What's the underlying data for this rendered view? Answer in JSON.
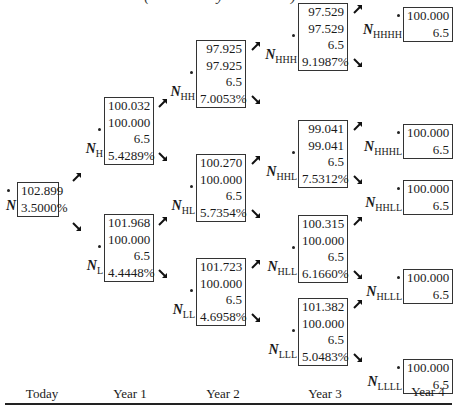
{
  "title_partial": "(cut off at top)",
  "nodes": {
    "N": {
      "label_main": "N",
      "label_sub": "",
      "values": [
        "102.899",
        "3.5000%"
      ]
    },
    "NH": {
      "label_main": "N",
      "label_sub": "H",
      "values": [
        "100.032",
        "100.000",
        "6.5",
        "5.4289%"
      ]
    },
    "NL": {
      "label_main": "N",
      "label_sub": "L",
      "values": [
        "101.968",
        "100.000",
        "6.5",
        "4.4448%"
      ]
    },
    "NHH": {
      "label_main": "N",
      "label_sub": "HH",
      "values": [
        "97.925",
        "97.925",
        "6.5",
        "7.0053%"
      ]
    },
    "NHL": {
      "label_main": "N",
      "label_sub": "HL",
      "values": [
        "100.270",
        "100.000",
        "6.5",
        "5.7354%"
      ]
    },
    "NLL": {
      "label_main": "N",
      "label_sub": "LL",
      "values": [
        "101.723",
        "100.000",
        "6.5",
        "4.6958%"
      ]
    },
    "NHHH": {
      "label_main": "N",
      "label_sub": "HHH",
      "values": [
        "97.529",
        "97.529",
        "6.5",
        "9.1987%"
      ]
    },
    "NHHL": {
      "label_main": "N",
      "label_sub": "HHL",
      "values": [
        "99.041",
        "99.041",
        "6.5",
        "7.5312%"
      ]
    },
    "NHLL": {
      "label_main": "N",
      "label_sub": "HLL",
      "values": [
        "100.315",
        "100.000",
        "6.5",
        "6.1660%"
      ]
    },
    "NLLL": {
      "label_main": "N",
      "label_sub": "LLL",
      "values": [
        "101.382",
        "100.000",
        "6.5",
        "5.0483%"
      ]
    },
    "NHHHH": {
      "label_main": "N",
      "label_sub": "HHHH",
      "values": [
        "100.000",
        "6.5"
      ]
    },
    "NHHHL": {
      "label_main": "N",
      "label_sub": "HHHL",
      "values": [
        "100.000",
        "6.5"
      ]
    },
    "NHHLL": {
      "label_main": "N",
      "label_sub": "HHLL",
      "values": [
        "100.000",
        "6.5"
      ]
    },
    "NHLLL": {
      "label_main": "N",
      "label_sub": "HLLL",
      "values": [
        "100.000",
        "6.5"
      ]
    },
    "NLLLL": {
      "label_main": "N",
      "label_sub": "LLLL",
      "values": [
        "100.000",
        "6.5"
      ]
    }
  },
  "axis": {
    "labels": [
      "Today",
      "Year 1",
      "Year 2",
      "Year 3",
      "Year 4"
    ]
  }
}
